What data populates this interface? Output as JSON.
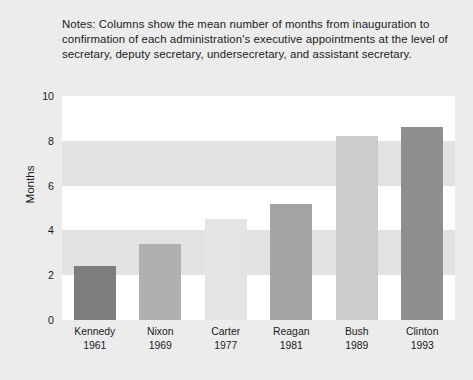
{
  "notes": {
    "text": "Notes: Columns show the mean number of months from inauguration to confirmation of each administration's executive appointments at the level of secretary, deputy secretary, undersecretary, and assistant secretary."
  },
  "chart_data": {
    "type": "bar",
    "title": "",
    "xlabel": "",
    "ylabel": "Months",
    "ylim": [
      0,
      10
    ],
    "yticks": [
      0,
      2,
      4,
      6,
      8,
      10
    ],
    "grid": "horizontal-bands",
    "legend": "none",
    "categories": [
      "Kennedy",
      "Nixon",
      "Carter",
      "Reagan",
      "Bush",
      "Clinton"
    ],
    "category_years": [
      "1961",
      "1969",
      "1977",
      "1981",
      "1989",
      "1993"
    ],
    "values": [
      2.4,
      3.4,
      4.5,
      5.2,
      8.2,
      8.6
    ],
    "bar_colors": [
      "#7d7d7d",
      "#b0b0b0",
      "#e4e4e4",
      "#a3a3a3",
      "#cccccc",
      "#8e8e8e"
    ]
  },
  "colors": {
    "page_background": "#ececec",
    "plot_background": "#ffffff",
    "band": "#e2e2e2",
    "text": "#1b1b1b"
  }
}
